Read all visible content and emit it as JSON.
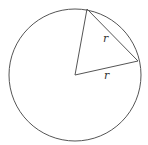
{
  "diagram": {
    "type": "geometry",
    "colors": {
      "stroke": "#555555",
      "background": "#ffffff",
      "label": "#333333"
    },
    "circle": {
      "cx": 75,
      "cy": 75,
      "r": 66
    },
    "points": {
      "center": {
        "x": 75,
        "y": 75
      },
      "top": {
        "x": 87,
        "y": 9
      },
      "right": {
        "x": 138,
        "y": 61
      }
    },
    "segments": [
      {
        "name": "radius-to-top",
        "from": "center",
        "to": "top"
      },
      {
        "name": "radius-to-right",
        "from": "center",
        "to": "right",
        "label": "r"
      },
      {
        "name": "chord",
        "from": "top",
        "to": "right",
        "label": "r"
      }
    ],
    "labels": {
      "chord_label": {
        "text": "r",
        "x": 103,
        "y": 42
      },
      "radius_label": {
        "text": "r",
        "x": 104,
        "y": 79
      }
    }
  }
}
